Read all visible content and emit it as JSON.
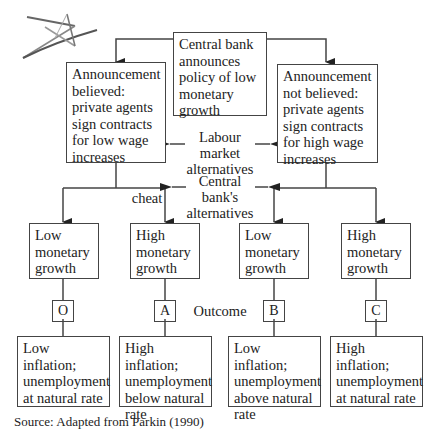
{
  "diagram": {
    "root": {
      "text": "Central bank announces policy of low monetary growth"
    },
    "labour_market": {
      "label": "Labour market alternatives",
      "left": {
        "text": "Announcement believed: private agents sign contracts for low wage increases"
      },
      "right": {
        "text": "Announcement not believed: private agents sign contracts for high wage increases"
      }
    },
    "central_bank": {
      "label": "Central bank's alternatives",
      "cheat_label": "cheat",
      "options": [
        {
          "text": "Low monetary growth"
        },
        {
          "text": "High monetary growth"
        },
        {
          "text": "Low monetary growth"
        },
        {
          "text": "High monetary growth"
        }
      ]
    },
    "outcome_label": "Outcome",
    "outcomes": [
      {
        "code": "O",
        "text": "Low inflation; unemployment at natural rate"
      },
      {
        "code": "A",
        "text": "High inflation; unemployment below natural rate"
      },
      {
        "code": "B",
        "text": "Low inflation; unemployment above natural rate"
      },
      {
        "code": "C",
        "text": "High inflation; unemployment at natural rate"
      }
    ],
    "source": "Source: Adapted from Parkin (1990)"
  },
  "colors": {
    "line": "#444444",
    "star": "#555555"
  }
}
